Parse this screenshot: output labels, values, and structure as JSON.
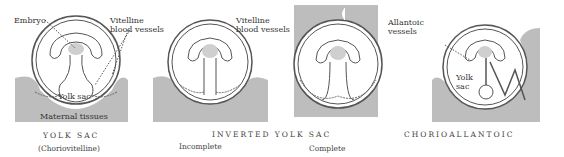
{
  "panels": [
    {
      "caption": "YOLK SAC",
      "subcaption": "(Choriovitelline)",
      "labels": {
        "embryo": "Embryo",
        "vessels_1": "Vitelline",
        "vessels_2": "blood vessels",
        "yolk_sac": "Yolk sac",
        "maternal": "Maternal tissues"
      }
    },
    {
      "caption": "INVERTED YOLK SAC",
      "subcaption": "Incomplete"
    },
    {
      "subcaption": "Complete",
      "labels": {
        "vessels_1": "Vitelline",
        "vessels_2": "blood vessels"
      }
    },
    {
      "caption": "CHORIOALLANTOIC",
      "labels": {
        "vessels_1": "Allantoic",
        "vessels_2": "vessels",
        "yolk_1": "Yolk",
        "yolk_2": "sac"
      }
    }
  ],
  "colors": {
    "tissue": "#bdbdbd",
    "embryo": "#cfcfcf",
    "line": "#444444"
  }
}
